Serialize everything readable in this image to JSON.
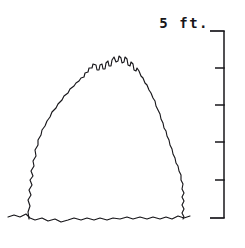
{
  "figure": {
    "background_color": "#ffffff",
    "ink_color": "#17161a",
    "width": 245,
    "height": 248
  },
  "scale": {
    "label": "5 ft.",
    "unit": "ft.",
    "total": 5,
    "divisions": 5,
    "tick_count": 6,
    "tick_labels": [
      "5",
      "4",
      "3",
      "2",
      "1",
      "0"
    ],
    "orientation": "vertical",
    "tick_side": "left",
    "axis_x": 224,
    "axis_top_y": 31,
    "axis_bottom_y": 218,
    "tick_y_positions": [
      31,
      68,
      105,
      142,
      180,
      218
    ],
    "tick_length_major": 14,
    "tick_length_minor": 9
  },
  "subject": {
    "name": "shrub-silhouette",
    "description": "Hand-drawn jagged outline of a rounded, dome-shaped shrub crown rising from a ground line",
    "peak_x": 118,
    "peak_y": 57,
    "base_left_x": 26,
    "base_right_x": 186,
    "base_y": 219,
    "height_in_units": 4.35,
    "outline_path": "M 29 219 L 28 212 L 30 206 L 28 200 L 31 195 L 29 190 L 32 185 L 30 180 L 33 176 L 31 171 L 34 166 L 33 161 L 36 156 L 35 150 L 38 145 L 38 140 L 41 135 L 42 130 L 45 126 L 47 121 L 50 117 L 52 112 L 56 108 L 58 104 L 62 100 L 64 96 L 68 93 L 70 89 L 74 86 L 76 83 L 79 81 L 81 78 L 84 77 L 85 73 L 88 72 L 89 68 L 92 68 L 93 64 L 96 65 L 97 70 L 99 70 L 100 65 L 102 64 L 103 69 L 105 69 L 106 63 L 108 61 L 109 66 L 111 66 L 112 60 L 114 57 L 116 62 L 118 61 L 119 56 L 121 58 L 122 63 L 124 62 L 125 57 L 127 59 L 128 65 L 130 66 L 131 62 L 133 64 L 134 70 L 136 71 L 137 68 L 139 71 L 141 76 L 143 78 L 145 83 L 147 85 L 149 90 L 151 93 L 153 98 L 155 101 L 156 106 L 158 110 L 160 114 L 161 119 L 163 123 L 164 128 L 166 131 L 167 136 L 169 140 L 170 145 L 172 149 L 173 154 L 175 158 L 176 163 L 178 166 L 179 171 L 181 175 L 181 180 L 183 184 L 182 189 L 184 193 L 182 197 L 184 201 L 182 205 L 184 209 L 182 213 L 184 217 L 183 219",
    "ground_path": "M 8 217 L 14 215 L 20 217 L 26 214 L 30 218 L 35 220 L 42 218 L 48 221 L 55 219 L 61 222 L 68 220 L 74 218 L 81 220 L 87 218 L 94 220 L 100 218 L 107 220 L 113 218 L 120 219 L 127 217 L 133 219 L 140 217 L 147 219 L 153 217 L 160 219 L 166 217 L 172 219 L 178 216 L 184 218 L 190 216"
  }
}
